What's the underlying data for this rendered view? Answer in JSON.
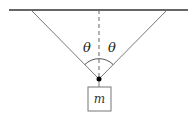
{
  "diagram": {
    "angle_label_left": "θ",
    "angle_label_right": "θ",
    "mass_label": "m",
    "colors": {
      "ceiling": "#333333",
      "strings": "#777777",
      "dashed_vertical": "#666666",
      "knot": "#000000",
      "box_stroke": "#777777"
    }
  }
}
